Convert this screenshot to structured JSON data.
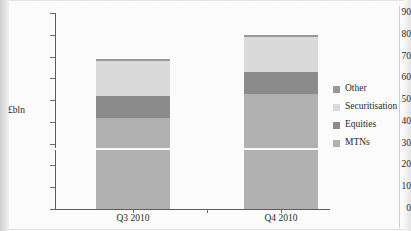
{
  "chart_data": {
    "type": "bar",
    "subtype": "stacked-bar",
    "title": "",
    "xlabel": "",
    "ylabel": "£bln",
    "ylim": [
      0,
      90
    ],
    "yticks": [
      0,
      10,
      20,
      30,
      40,
      50,
      60,
      70,
      80,
      90
    ],
    "ytick_labels": [
      "0",
      "10",
      "20",
      "30",
      "40",
      "50",
      "60",
      "70",
      "80",
      "90"
    ],
    "grid": false,
    "legend_position": "right",
    "categories": [
      "Q3 2010",
      "Q4 2010"
    ],
    "series": [
      {
        "name": "MTNs",
        "values": [
          42,
          53
        ],
        "color": "#b2b2b2"
      },
      {
        "name": "Equities",
        "values": [
          10,
          10
        ],
        "color": "#8c8c8c"
      },
      {
        "name": "Securitisation",
        "values": [
          16,
          16
        ],
        "color": "#dcdcdc"
      },
      {
        "name": "Other",
        "values": [
          1,
          1
        ],
        "color": "#9a9a9a"
      }
    ],
    "stack_order_bottom_to_top": [
      "MTNs",
      "Equities",
      "Securitisation",
      "Other"
    ],
    "totals": [
      69,
      80
    ],
    "legend_order_top_to_bottom": [
      "Other",
      "Securitisation",
      "Equities",
      "MTNs"
    ]
  },
  "axes": {
    "y_title": "£bln",
    "y_ticks": [
      {
        "value": 90,
        "label": "90"
      },
      {
        "value": 80,
        "label": "80"
      },
      {
        "value": 70,
        "label": "70"
      },
      {
        "value": 60,
        "label": "60"
      },
      {
        "value": 50,
        "label": "50"
      },
      {
        "value": 40,
        "label": "40"
      },
      {
        "value": 30,
        "label": "30"
      },
      {
        "value": 20,
        "label": "20"
      },
      {
        "value": 10,
        "label": "10"
      },
      {
        "value": 0,
        "label": "0"
      }
    ],
    "x_ticks": [
      {
        "label": "Q3 2010"
      },
      {
        "label": "Q4 2010"
      }
    ]
  },
  "legend": {
    "items": [
      {
        "label": "Other",
        "color": "#9a9a9a"
      },
      {
        "label": "Securitisation",
        "color": "#dcdcdc"
      },
      {
        "label": "Equities",
        "color": "#8c8c8c"
      },
      {
        "label": "MTNs",
        "color": "#b2b2b2"
      }
    ]
  },
  "style": {
    "axis_color": "#5d5d5d",
    "text_color": "#2a2a2a",
    "background": "#fdfdfd"
  }
}
